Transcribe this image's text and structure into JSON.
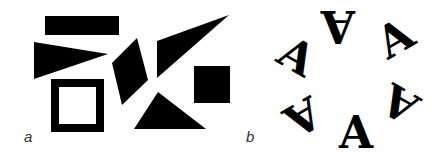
{
  "figure": {
    "background": "#ffffff",
    "ink_color": "#000000",
    "panels": [
      {
        "id": "a",
        "label": "a",
        "description": "Scattered black geometric shapes",
        "shapes": [
          {
            "type": "rectangle",
            "name": "top-bar",
            "x": 45,
            "y": 16,
            "width": 74,
            "height": 19
          },
          {
            "type": "triangle",
            "name": "left-wedge",
            "points": "34,42 108,54 34,79"
          },
          {
            "type": "hollow-square",
            "name": "outline-square",
            "x": 51,
            "y": 79,
            "size": 53,
            "stroke": 8
          },
          {
            "type": "quadrilateral",
            "name": "rhombus",
            "points": "112,63 137,38 148,80 122,105"
          },
          {
            "type": "triangle",
            "name": "long-wedge",
            "points": "157,41 229,15 157,78"
          },
          {
            "type": "rectangle",
            "name": "solid-square",
            "x": 194,
            "y": 66,
            "width": 36,
            "height": 37
          },
          {
            "type": "triangle",
            "name": "bottom-triangle",
            "points": "134,129 158,92 206,129"
          }
        ]
      },
      {
        "id": "b",
        "label": "b",
        "description": "Six letter A glyphs arranged in a ring at rotating orientations",
        "glyph": "A",
        "center": [
          352,
          86
        ],
        "letters": [
          {
            "x": 338,
            "y": 26,
            "rotation": 180
          },
          {
            "x": 392,
            "y": 40,
            "rotation": -30
          },
          {
            "x": 400,
            "y": 105,
            "rotation": 210
          },
          {
            "x": 356,
            "y": 130,
            "rotation": 0
          },
          {
            "x": 305,
            "y": 115,
            "rotation": 150
          },
          {
            "x": 298,
            "y": 55,
            "rotation": 30
          }
        ]
      }
    ]
  }
}
